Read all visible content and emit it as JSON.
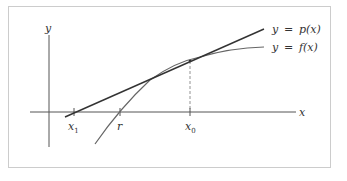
{
  "figure": {
    "axes": {
      "x_label": "x",
      "y_label": "y"
    },
    "curves": [
      {
        "name": "tangent",
        "label_lhs": "y",
        "label_eq": "=",
        "label_rhs": "p(x)"
      },
      {
        "name": "function",
        "label_lhs": "y",
        "label_eq": "=",
        "label_rhs": "f(x)"
      }
    ],
    "x_ticks": [
      {
        "name": "x1",
        "base": "x",
        "sub": "1"
      },
      {
        "name": "r",
        "base": "r",
        "sub": ""
      },
      {
        "name": "x0",
        "base": "x",
        "sub": "0"
      }
    ]
  },
  "colors": {
    "frame": "#cccccc",
    "lines": "#444444",
    "curve": "#666666",
    "text": "#333333"
  }
}
